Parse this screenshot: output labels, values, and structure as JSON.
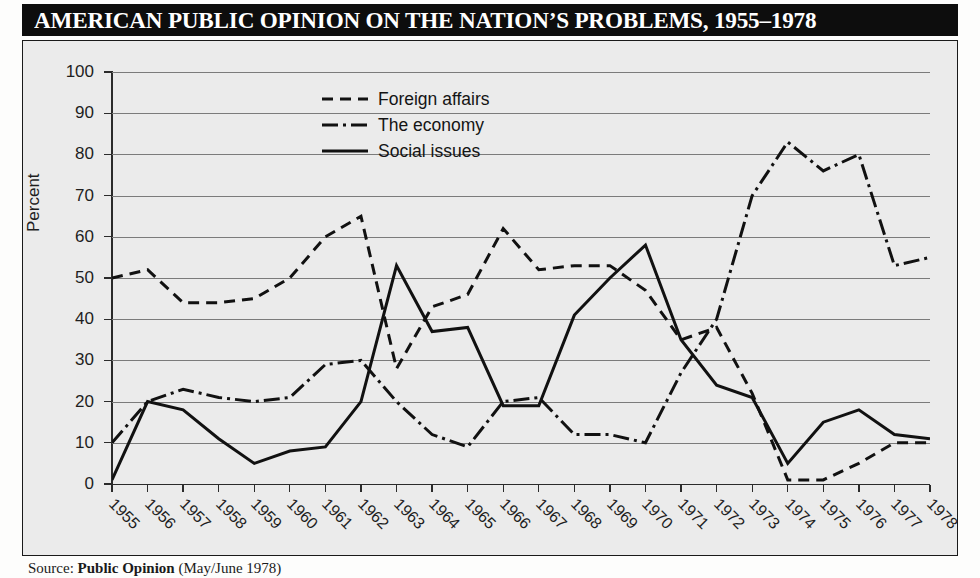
{
  "title": "AMERICAN PUBLIC OPINION ON THE NATION’S PROBLEMS, 1955–1978",
  "source": "Source: Public Opinion (May/June 1978)",
  "source_prefix": "Source: ",
  "source_italic": "Public Opinion",
  "source_suffix": " (May/June 1978)",
  "colors": {
    "banner_bg": "#0d0d0d",
    "banner_text": "#ffffff",
    "plot_bg": "#ebebeb",
    "gridline": "#7b7b7b",
    "axis": "#2b2b2b",
    "series": "#111111"
  },
  "legend": {
    "position": "inside-top-center",
    "items": [
      {
        "label": "Foreign affairs",
        "style": "dashed",
        "swatch": "dash-line-icon"
      },
      {
        "label": "The economy",
        "style": "dash-dot",
        "swatch": "dash-dot-line-icon"
      },
      {
        "label": "Social issues",
        "style": "solid",
        "swatch": "solid-line-icon"
      }
    ]
  },
  "chart_data": {
    "type": "line",
    "title": "AMERICAN PUBLIC OPINION ON THE NATION’S PROBLEMS, 1955–1978",
    "xlabel": "",
    "ylabel": "Percent",
    "ylim": [
      0,
      100
    ],
    "ytick_labels": [
      "0",
      "10",
      "20",
      "30",
      "40",
      "50",
      "60",
      "70",
      "80",
      "90",
      "100"
    ],
    "yticks": [
      0,
      10,
      20,
      30,
      40,
      50,
      60,
      70,
      80,
      90,
      100
    ],
    "grid": true,
    "x": [
      1955,
      1956,
      1957,
      1958,
      1959,
      1960,
      1961,
      1962,
      1963,
      1964,
      1965,
      1966,
      1967,
      1968,
      1969,
      1970,
      1971,
      1972,
      1973,
      1974,
      1975,
      1976,
      1977,
      1978
    ],
    "categories": [
      "1955",
      "1956",
      "1957",
      "1958",
      "1959",
      "1960",
      "1961",
      "1962",
      "1963",
      "1964",
      "1965",
      "1966",
      "1967",
      "1968",
      "1969",
      "1970",
      "1971",
      "1972",
      "1973",
      "1974",
      "1975",
      "1976",
      "1977",
      "1978"
    ],
    "series": [
      {
        "name": "Foreign affairs",
        "style": "dashed",
        "values": [
          50,
          52,
          44,
          44,
          45,
          50,
          60,
          65,
          28,
          43,
          46,
          62,
          52,
          53,
          53,
          47,
          35,
          38,
          22,
          1,
          1,
          5,
          10,
          10
        ]
      },
      {
        "name": "The economy",
        "style": "dash-dot",
        "values": [
          10,
          20,
          23,
          21,
          20,
          21,
          29,
          30,
          20,
          12,
          9,
          20,
          21,
          12,
          12,
          10,
          27,
          40,
          70,
          83,
          76,
          80,
          53,
          55
        ]
      },
      {
        "name": "Social issues",
        "style": "solid",
        "values": [
          1,
          20,
          18,
          11,
          5,
          8,
          9,
          20,
          53,
          37,
          38,
          19,
          19,
          41,
          50,
          58,
          35,
          24,
          21,
          5,
          15,
          18,
          12,
          11
        ]
      }
    ]
  }
}
